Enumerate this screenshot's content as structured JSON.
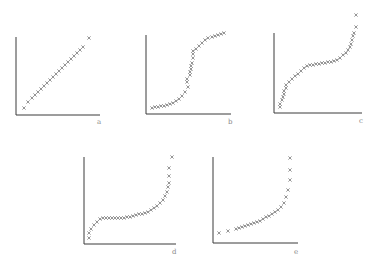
{
  "chart_data": [
    {
      "type": "scatter",
      "label": "a",
      "marker": "x",
      "description": "uniform / straight-line cumulative pattern",
      "frame": {
        "x0": 16,
        "y0": 115,
        "x1": 100,
        "ytop": 37,
        "label_x": 97,
        "label_y": 124
      },
      "points": [
        [
          24,
          108
        ],
        [
          28,
          102
        ],
        [
          32,
          98
        ],
        [
          35,
          95
        ],
        [
          38,
          92
        ],
        [
          41,
          89
        ],
        [
          44,
          86
        ],
        [
          47,
          83
        ],
        [
          50,
          80
        ],
        [
          53,
          77
        ],
        [
          56,
          74
        ],
        [
          59,
          71
        ],
        [
          62,
          68
        ],
        [
          65,
          65
        ],
        [
          68,
          62
        ],
        [
          71,
          59
        ],
        [
          74,
          56
        ],
        [
          77,
          53
        ],
        [
          80,
          50
        ],
        [
          83,
          47
        ],
        [
          89,
          38
        ]
      ]
    },
    {
      "type": "scatter",
      "label": "b",
      "marker": "x",
      "description": "S-shaped curve",
      "frame": {
        "x0": 146,
        "y0": 114,
        "x1": 231,
        "ytop": 35,
        "label_x": 228,
        "label_y": 124
      },
      "points": [
        [
          152,
          108
        ],
        [
          155,
          107
        ],
        [
          158,
          107
        ],
        [
          161,
          106
        ],
        [
          164,
          106
        ],
        [
          167,
          105
        ],
        [
          170,
          104
        ],
        [
          173,
          103
        ],
        [
          176,
          101
        ],
        [
          179,
          99
        ],
        [
          182,
          96
        ],
        [
          185,
          92
        ],
        [
          188,
          87
        ],
        [
          187,
          82
        ],
        [
          187,
          79
        ],
        [
          190,
          75
        ],
        [
          190,
          72
        ],
        [
          191,
          69
        ],
        [
          191,
          66
        ],
        [
          192,
          63
        ],
        [
          193,
          58
        ],
        [
          193,
          54
        ],
        [
          193,
          51
        ],
        [
          196,
          49
        ],
        [
          199,
          46
        ],
        [
          202,
          43
        ],
        [
          205,
          40
        ],
        [
          208,
          38
        ],
        [
          212,
          37
        ],
        [
          215,
          36
        ],
        [
          218,
          35
        ],
        [
          221,
          34
        ],
        [
          224,
          33
        ]
      ]
    },
    {
      "type": "scatter",
      "label": "c",
      "marker": "x",
      "description": "heavy-tailed: steep at both ends, flat middle",
      "frame": {
        "x0": 274,
        "y0": 113,
        "x1": 362,
        "ytop": 33,
        "label_x": 359,
        "label_y": 123
      },
      "points": [
        [
          280,
          107
        ],
        [
          280,
          104
        ],
        [
          282,
          100
        ],
        [
          283,
          97
        ],
        [
          284,
          94
        ],
        [
          284,
          91
        ],
        [
          286,
          88
        ],
        [
          286,
          85
        ],
        [
          289,
          82
        ],
        [
          292,
          79
        ],
        [
          295,
          76
        ],
        [
          298,
          74
        ],
        [
          301,
          71
        ],
        [
          304,
          68
        ],
        [
          307,
          66
        ],
        [
          310,
          65
        ],
        [
          313,
          65
        ],
        [
          316,
          64
        ],
        [
          319,
          64
        ],
        [
          322,
          63
        ],
        [
          325,
          63
        ],
        [
          328,
          62
        ],
        [
          331,
          62
        ],
        [
          334,
          61
        ],
        [
          337,
          60
        ],
        [
          340,
          58
        ],
        [
          343,
          55
        ],
        [
          346,
          53
        ],
        [
          348,
          50
        ],
        [
          350,
          47
        ],
        [
          351,
          44
        ],
        [
          352,
          40
        ],
        [
          353,
          36
        ],
        [
          354,
          33
        ],
        [
          356,
          27
        ],
        [
          356,
          15
        ]
      ]
    },
    {
      "type": "scatter",
      "label": "d",
      "marker": "x",
      "description": "right-skewed: steep rise at start, flat middle, steep rise at end",
      "frame": {
        "x0": 84,
        "y0": 244,
        "x1": 176,
        "ytop": 157,
        "label_x": 172,
        "label_y": 254
      },
      "points": [
        [
          89,
          238
        ],
        [
          89,
          233
        ],
        [
          91,
          229
        ],
        [
          94,
          225
        ],
        [
          97,
          222
        ],
        [
          100,
          219
        ],
        [
          103,
          218
        ],
        [
          106,
          218
        ],
        [
          109,
          218
        ],
        [
          112,
          218
        ],
        [
          115,
          218
        ],
        [
          118,
          218
        ],
        [
          121,
          218
        ],
        [
          124,
          218
        ],
        [
          127,
          217
        ],
        [
          130,
          217
        ],
        [
          133,
          216
        ],
        [
          136,
          215
        ],
        [
          139,
          214
        ],
        [
          142,
          214
        ],
        [
          145,
          213
        ],
        [
          148,
          212
        ],
        [
          151,
          210
        ],
        [
          154,
          208
        ],
        [
          157,
          206
        ],
        [
          160,
          203
        ],
        [
          163,
          200
        ],
        [
          165,
          196
        ],
        [
          167,
          192
        ],
        [
          168,
          187
        ],
        [
          169,
          183
        ],
        [
          169,
          176
        ],
        [
          169,
          168
        ],
        [
          172,
          157
        ]
      ]
    },
    {
      "type": "scatter",
      "label": "e",
      "marker": "x",
      "description": "exponential-like: gradual rise then sharp upturn",
      "frame": {
        "x0": 213,
        "y0": 243,
        "x1": 298,
        "ytop": 157,
        "label_x": 294,
        "label_y": 254
      },
      "points": [
        [
          219,
          233
        ],
        [
          228,
          231
        ],
        [
          236,
          229
        ],
        [
          239,
          228
        ],
        [
          242,
          227
        ],
        [
          245,
          226
        ],
        [
          248,
          225
        ],
        [
          251,
          224
        ],
        [
          254,
          223
        ],
        [
          257,
          222
        ],
        [
          260,
          221
        ],
        [
          263,
          219
        ],
        [
          266,
          217
        ],
        [
          269,
          216
        ],
        [
          272,
          214
        ],
        [
          275,
          212
        ],
        [
          278,
          210
        ],
        [
          281,
          207
        ],
        [
          284,
          203
        ],
        [
          286,
          197
        ],
        [
          288,
          190
        ],
        [
          290,
          180
        ],
        [
          290,
          170
        ],
        [
          290,
          158
        ]
      ]
    }
  ]
}
